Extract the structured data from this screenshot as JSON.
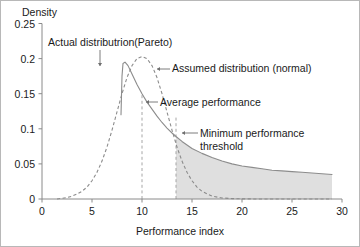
{
  "chart_data": {
    "type": "line",
    "title": "",
    "xlabel": "Performance index",
    "ylabel": "Density",
    "xlim": [
      0,
      30
    ],
    "ylim": [
      0,
      0.25
    ],
    "xticks": [
      "0",
      "5",
      "10",
      "15",
      "20",
      "25",
      "30"
    ],
    "xtick_values": [
      0,
      5,
      10,
      15,
      20,
      25,
      30
    ],
    "yticks": [
      "0",
      "0.05",
      "0.1",
      "0.15",
      "0.2",
      "0.25"
    ],
    "ytick_values": [
      0,
      0.05,
      0.1,
      0.15,
      0.2,
      0.25
    ],
    "grid": false,
    "legend_position": "none",
    "series": [
      {
        "name": "Actual distributrion(Pareto)",
        "style": "solid",
        "color": "#8c8c8c",
        "x": [
          7.9,
          8.0,
          8.1,
          8.3,
          8.6,
          9.0,
          9.5,
          10.0,
          10.5,
          11.0,
          11.5,
          12.0,
          12.5,
          13.0,
          13.4,
          14.0,
          15.0,
          16.0,
          17.0,
          18.0,
          19.0,
          20.0,
          21.0,
          22.0,
          23.0,
          24.0,
          25.0,
          26.0,
          27.0,
          28.0,
          29.0
        ],
        "y": [
          0.12,
          0.175,
          0.193,
          0.195,
          0.19,
          0.178,
          0.163,
          0.15,
          0.138,
          0.128,
          0.118,
          0.109,
          0.101,
          0.094,
          0.089,
          0.082,
          0.072,
          0.065,
          0.059,
          0.054,
          0.05,
          0.047,
          0.045,
          0.043,
          0.041,
          0.04,
          0.039,
          0.038,
          0.037,
          0.036,
          0.035
        ]
      },
      {
        "name": "Assumed distribution (normal)",
        "style": "dashed",
        "color": "#8c8c8c",
        "x": [
          1.5,
          2.5,
          3.0,
          3.5,
          4.0,
          4.5,
          5.0,
          5.5,
          6.0,
          6.5,
          7.0,
          7.5,
          8.0,
          8.5,
          9.0,
          9.5,
          10.0,
          10.5,
          11.0,
          11.5,
          12.0,
          12.5,
          13.0,
          13.5,
          14.0,
          14.5,
          15.0,
          15.5,
          16.0,
          17.0,
          18.0,
          19.0,
          20.0,
          22.0,
          25.0,
          29.0
        ],
        "y": [
          0.0,
          0.002,
          0.004,
          0.007,
          0.011,
          0.017,
          0.026,
          0.038,
          0.054,
          0.074,
          0.098,
          0.124,
          0.15,
          0.173,
          0.19,
          0.2,
          0.203,
          0.2,
          0.19,
          0.173,
          0.15,
          0.124,
          0.098,
          0.074,
          0.054,
          0.038,
          0.026,
          0.017,
          0.011,
          0.004,
          0.0015,
          0.0006,
          0.0002,
          0.0,
          0.0,
          0.0
        ]
      }
    ],
    "vertical_markers": [
      {
        "name": "Average performance",
        "x": 10,
        "y_top": 0.148,
        "style": "dashed"
      },
      {
        "name": "Minimum performance threshold",
        "x": 13.4,
        "y_top": 0.118,
        "style": "dashed"
      }
    ],
    "shaded_region": {
      "label": "Tail area beyond minimum performance threshold",
      "x_start": 13.4,
      "x_end": 29,
      "under_series": "Actual distributrion(Pareto)",
      "color": "#d9d9d9"
    },
    "annotations": [
      {
        "name": "actual-distribution-label",
        "text": "Actual distributrion(Pareto)",
        "arrow": "down",
        "points_to_x": 8.0
      },
      {
        "name": "assumed-distribution-label",
        "text": "Assumed distribution (normal)",
        "arrow": "left",
        "points_to_x": 11.6
      },
      {
        "name": "average-performance-label",
        "text": "Average performance",
        "arrow": "left",
        "points_to_x": 10
      },
      {
        "name": "minimum-threshold-label-line1",
        "text": "Minimum performance",
        "arrow": "left",
        "points_to_x": 13.4
      },
      {
        "name": "minimum-threshold-label-line2",
        "text": "threshold",
        "arrow": "none",
        "points_to_x": 13.4
      }
    ]
  }
}
